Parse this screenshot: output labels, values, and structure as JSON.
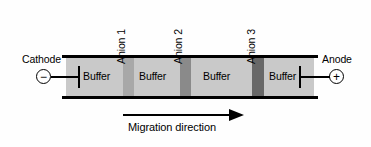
{
  "diagram": {
    "background_color": "#fefefe",
    "gel": {
      "fill_color": "#c9c9c9",
      "rail_color": "#000000",
      "buffer_zones": [
        {
          "label": "Buffer"
        },
        {
          "label": "Buffer"
        },
        {
          "label": "Buffer"
        },
        {
          "label": "Buffer"
        }
      ],
      "anion_bands": [
        {
          "label": "Anion 1",
          "color": "#a8a8a8"
        },
        {
          "label": "Anion 2",
          "color": "#8a8a8a"
        },
        {
          "label": "Anion 3",
          "color": "#686868"
        }
      ]
    },
    "electrodes": {
      "cathode": {
        "name": "Cathode",
        "sign": "−",
        "icon": "minus-circle-icon"
      },
      "anode": {
        "name": "Anode",
        "sign": "+",
        "icon": "plus-circle-icon"
      }
    },
    "migration": {
      "label": "Migration direction",
      "direction": "right",
      "icon": "arrow-right-icon"
    }
  }
}
